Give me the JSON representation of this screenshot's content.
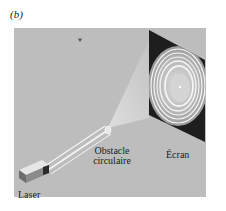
{
  "figure": {
    "panel_label": "(b)",
    "labels": {
      "laser": "Laser",
      "obstacle_line1": "Obstacle",
      "obstacle_line2": "circulaire",
      "screen": "Écran"
    },
    "colors": {
      "background": "#bdbdbd",
      "screen": "#1e1e1e",
      "beam": "#f2f2f2",
      "laser_body": "#7a7a7a"
    }
  }
}
